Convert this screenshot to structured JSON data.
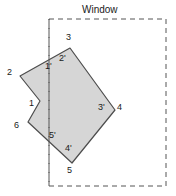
{
  "figure": {
    "title": "Window",
    "title_pos": {
      "x": 82,
      "y": 5
    },
    "colors": {
      "polygon_fill": "#d6d6d6",
      "polygon_stroke": "#4d4d4d",
      "window_stroke": "#555555",
      "text": "#1a1a1a",
      "background": "#ffffff"
    },
    "window_rect": {
      "x": 49,
      "y": 19,
      "width": 117,
      "height": 167,
      "dash": "5,4"
    },
    "polygon": {
      "points": "20,76 70,48 115,110 72,163 28,122 40,101",
      "stroke_width": 1.2
    },
    "clip_edge_line": {
      "x1": 49,
      "y1": 19,
      "x2": 49,
      "y2": 186
    },
    "vertices": [
      {
        "label": "3",
        "x": 66,
        "y": 33
      },
      {
        "label": "2'",
        "x": 59,
        "y": 54
      },
      {
        "label": "1'",
        "x": 45,
        "y": 62
      },
      {
        "label": "2",
        "x": 7,
        "y": 68
      },
      {
        "label": "1",
        "x": 29,
        "y": 99
      },
      {
        "label": "3'",
        "x": 98,
        "y": 103
      },
      {
        "label": "4",
        "x": 117,
        "y": 103
      },
      {
        "label": "6",
        "x": 14,
        "y": 121
      },
      {
        "label": "5'",
        "x": 49,
        "y": 131
      },
      {
        "label": "4'",
        "x": 65,
        "y": 144
      },
      {
        "label": "5",
        "x": 67,
        "y": 166
      }
    ]
  }
}
